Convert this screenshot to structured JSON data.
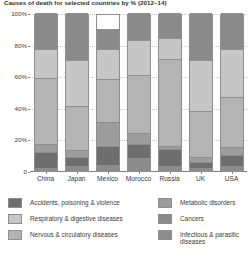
{
  "chart_data": {
    "type": "bar",
    "subtype": "100% stacked column",
    "title": "Causes of death for selected countries by % (2012–14)",
    "xlabel": "",
    "ylabel": "",
    "ylim": [
      0,
      100
    ],
    "ytick_labels": [
      "0",
      "20%",
      "40%",
      "60%",
      "80%",
      "100%"
    ],
    "ytick_values": [
      0,
      20,
      40,
      60,
      80,
      100
    ],
    "grid": true,
    "legend_position": "bottom",
    "categories": [
      "China",
      "Japan",
      "Mexico",
      "Morocco",
      "Russia",
      "UK",
      "USA"
    ],
    "stack_order_bottom_to_top": [
      "Infectious & parasitic diseases",
      "Accidents, poisoning & violence",
      "Metabolic disorders",
      "Nervous & circulatory diseases",
      "Respiratory & digestive diseases",
      "Cancers"
    ],
    "series": [
      {
        "name": "Infectious & parasitic diseases",
        "color": "#8c8c8c",
        "values": [
          2,
          3,
          4,
          8,
          3,
          2,
          3
        ]
      },
      {
        "name": "Accidents, poisoning & violence",
        "color": "#6e6e6e",
        "values": [
          10,
          6,
          12,
          9,
          11,
          4,
          7
        ]
      },
      {
        "name": "Metabolic disorders",
        "color": "#9d9d9d",
        "values": [
          5,
          4,
          15,
          7,
          2,
          3,
          5
        ]
      },
      {
        "name": "Nervous & circulatory diseases",
        "color": "#b4b4b4",
        "values": [
          42,
          28,
          27,
          37,
          55,
          29,
          32
        ]
      },
      {
        "name": "Respiratory & digestive diseases",
        "color": "#c6c6c6",
        "values": [
          18,
          29,
          19,
          22,
          13,
          32,
          30
        ]
      },
      {
        "name": "Cancers",
        "color": "#8a8a8a",
        "values": [
          23,
          30,
          13,
          17,
          16,
          30,
          23
        ]
      }
    ]
  },
  "legend": {
    "left_items": [
      {
        "label": "Accidents, poisoning & violence",
        "color": "#6e6e6e"
      },
      {
        "label": "Respiratory & digestive diseases",
        "color": "#c6c6c6"
      },
      {
        "label": "Nervous & circulatory diseases",
        "color": "#b4b4b4"
      }
    ],
    "right_items": [
      {
        "label": "Metabolic disorders",
        "color": "#9d9d9d"
      },
      {
        "label": "Cancers",
        "color": "#8a8a8a"
      },
      {
        "label": "Infectious & parasitic diseases",
        "color": "#8c8c8c"
      }
    ]
  }
}
